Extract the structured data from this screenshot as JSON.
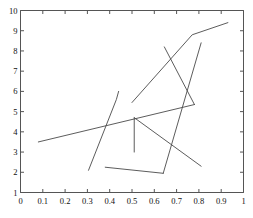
{
  "chart_data": {
    "type": "line",
    "title": "",
    "xlabel": "",
    "ylabel": "",
    "xlim": [
      0,
      1
    ],
    "ylim": [
      1,
      10
    ],
    "grid": false,
    "legend": null,
    "xticks": [
      "0",
      "0.1",
      "0.2",
      "0.3",
      "0.4",
      "0.5",
      "0.6",
      "0.7",
      "0.8",
      "0.9",
      "1"
    ],
    "xtick_values": [
      0,
      0.1,
      0.2,
      0.3,
      0.4,
      0.5,
      0.6,
      0.7,
      0.8,
      0.9,
      1
    ],
    "yticks": [
      "1",
      "2",
      "3",
      "4",
      "5",
      "6",
      "7",
      "8",
      "9",
      "10"
    ],
    "ytick_values": [
      1,
      2,
      3,
      4,
      5,
      6,
      7,
      8,
      9,
      10
    ],
    "line_color": "#4a4a4a",
    "axis_color": "#555555",
    "background": "#ffffff",
    "series": [
      {
        "name": "trend-line",
        "points": [
          [
            0.08,
            3.5
          ],
          [
            0.78,
            5.35
          ]
        ]
      },
      {
        "name": "upper-right-line",
        "points": [
          [
            0.5,
            5.45
          ],
          [
            0.77,
            8.8
          ],
          [
            0.93,
            9.4
          ]
        ]
      },
      {
        "name": "descending-long-line",
        "points": [
          [
            0.645,
            8.2
          ],
          [
            0.78,
            5.35
          ]
        ]
      },
      {
        "name": "steep-right-line",
        "points": [
          [
            0.64,
            1.95
          ],
          [
            0.81,
            8.4
          ]
        ]
      },
      {
        "name": "lower-horizontal-line",
        "points": [
          [
            0.38,
            2.25
          ],
          [
            0.64,
            1.95
          ]
        ]
      },
      {
        "name": "left-rising-curve",
        "points": [
          [
            0.305,
            2.1
          ],
          [
            0.43,
            5.6
          ],
          [
            0.44,
            6.0
          ]
        ]
      },
      {
        "name": "vertical-stem",
        "points": [
          [
            0.51,
            4.7
          ],
          [
            0.51,
            3.0
          ]
        ]
      },
      {
        "name": "descending-short-line",
        "points": [
          [
            0.51,
            4.7
          ],
          [
            0.81,
            2.3
          ]
        ]
      }
    ]
  }
}
